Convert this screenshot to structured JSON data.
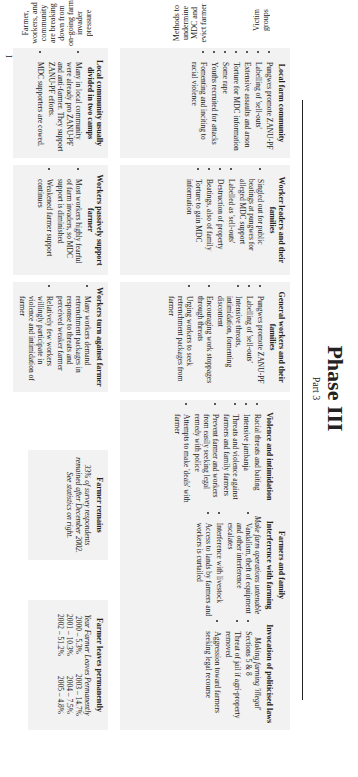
{
  "nav": {
    "pages": [
      "I",
      "II",
      "III",
      "IV"
    ],
    "active": "III"
  },
  "title": "Phase III",
  "subtitle": "Part 3",
  "side_labels": [
    "Victim groups",
    "Methods to undermine MDC and evict farmer",
    "Farmer, workers, and community are breaking down from on-going farm invader pressure"
  ],
  "groups": [
    {
      "heading": "Local farm community",
      "items": [
        "Pungwes promote ZANU-PF",
        "Labelling of 'sell-outs'",
        "Extensive assaults and arson",
        "Torture for MDC information",
        "Some rape",
        "Youths recruited for attacks",
        "Fomenting and inciting to racial violence"
      ]
    },
    {
      "heading": "Worker leaders and their families",
      "items": [
        "Singled out for public beatings at pungwes for alleged MDC support",
        "Labelled as 'sell-outs'",
        "Destruction of property",
        "Beatings, also of family",
        "Torture to gain MDC information"
      ]
    },
    {
      "heading": "General workers and their families",
      "items": [
        "Pungwes promote ZANU-PF",
        "Labelling of 'sell-outs'",
        "Intensive threats, intimidation, fomenting discontent",
        "Encouraging work stoppages through threats",
        "Urging workers to seek retrenchment packages from farmer"
      ]
    },
    {
      "heading": "Farmers and family",
      "subgroups": [
        {
          "heading": "Violence and intimidation",
          "items": [
            "Racial threats and baiting",
            "Intensive jambanja",
            "Threats and violence against farmers and family farmers",
            "Prevent farmer and workers from easily seeking legal remedy with police",
            "Attempts to make 'deals' with farmer"
          ]
        },
        {
          "heading": "Interference with farming",
          "note": "Make farm operations untenable",
          "items": [
            "Vandalism, theft of equipment and other interference escalates",
            "Interference with livestock",
            "Access to lands by farmers and workers is curtailed"
          ]
        },
        {
          "heading": "Invocation of politicised laws",
          "note": "Making farming 'illegal'",
          "items": [
            "Sections 5 & 8",
            "Threat of jail if agri-property removed",
            "Aggression toward farmers seeking legal recourse"
          ]
        }
      ]
    }
  ],
  "outcomes": [
    {
      "heading": "Local community usually divided in two camps",
      "items": [
        "Many in local community were already pro ZANU-PF and anti-farmer. They support ZANU-PF efforts.",
        "MDC supporters are cowed."
      ]
    },
    {
      "heading": "Workers passively support farmer",
      "items": [
        "Most workers highly fearful of farm invaders, so MDC support is diminished",
        "Weakened farmer support continues"
      ]
    },
    {
      "heading": "Workers turn against farmer",
      "items": [
        "Many workers demand retrenchment packages in response to threats and perceived weaker farmer",
        "Relatively few workers willingly participate in violence and intimidation of farmer"
      ]
    },
    {
      "heading": "Farmer remains",
      "text": "33% of survey respondents remained after December 2002. See statistics on right."
    },
    {
      "heading": "Farmer leaves permanently",
      "text": "Year Farmer Leaves Permanently",
      "stats": [
        "2000 – 5.3%",
        "2003 – 14.7%",
        "2001 – 10.3%",
        "2004 – 7.5%",
        "2002 – 51.2%",
        "2005 – 4.8%"
      ]
    }
  ]
}
